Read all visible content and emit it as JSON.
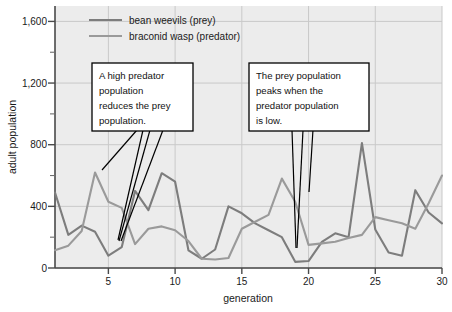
{
  "chart_data": {
    "type": "line",
    "title": "",
    "xlabel": "generation",
    "ylabel": "adult population",
    "xlim": [
      1,
      30
    ],
    "ylim": [
      0,
      1700
    ],
    "yticks": [
      0,
      400,
      800,
      1200,
      1600
    ],
    "ytick_labels": [
      "0",
      "400",
      "800",
      "1,200",
      "1,600"
    ],
    "yminorticks": [
      200,
      600,
      1000,
      1400
    ],
    "xticks": [
      5,
      10,
      15,
      20,
      25,
      30
    ],
    "xtick_labels": [
      "5",
      "10",
      "15",
      "20",
      "25",
      "30"
    ],
    "grid": true,
    "legend_position": "top-left-inside",
    "x": [
      1,
      2,
      3,
      4,
      5,
      6,
      7,
      8,
      9,
      10,
      11,
      12,
      13,
      14,
      15,
      16,
      17,
      18,
      19,
      20,
      21,
      22,
      23,
      24,
      25,
      26,
      27,
      28,
      29,
      30
    ],
    "series": [
      {
        "name": "bean weevils (prey)",
        "color": "#7d7d7d",
        "values": [
          490,
          215,
          275,
          235,
          80,
          135,
          500,
          375,
          615,
          560,
          115,
          60,
          120,
          400,
          355,
          290,
          245,
          200,
          40,
          45,
          170,
          225,
          200,
          810,
          250,
          100,
          80,
          505,
          360,
          290
        ]
      },
      {
        "name": "braconid wasp (predator)",
        "color": "#9a9a9a",
        "values": [
          115,
          145,
          240,
          620,
          430,
          390,
          155,
          255,
          270,
          245,
          175,
          60,
          55,
          65,
          255,
          300,
          345,
          580,
          430,
          150,
          160,
          170,
          195,
          215,
          330,
          310,
          290,
          255,
          420,
          600
        ]
      }
    ],
    "annotations": [
      {
        "id": "callout-predator-reduces-prey",
        "text": "A high predator population reduces the prey population.",
        "lines": [
          "A high predator",
          "population",
          "reduces the prey",
          "population."
        ],
        "points_to": [
          "generation 4 predator peak",
          "generation 5 prey low",
          "generation 6 predator"
        ]
      },
      {
        "id": "callout-prey-peaks",
        "text": "The prey population peaks when the predator population is low.",
        "lines": [
          "The prey population",
          "peaks when the",
          "predator population",
          "is low."
        ],
        "points_to": [
          "generation 19 prey low",
          "generation 20 predator"
        ]
      }
    ]
  },
  "axes": {
    "ylabel": "adult population",
    "xlabel": "generation"
  },
  "legend": {
    "items": [
      {
        "label": "bean weevils (prey)",
        "color": "#7d7d7d"
      },
      {
        "label": "braconid wasp (predator)",
        "color": "#9a9a9a"
      }
    ]
  },
  "callouts": [
    {
      "line1": "A high predator",
      "line2": "population",
      "line3": "reduces the prey",
      "line4": "population."
    },
    {
      "line1": "The prey population",
      "line2": "peaks when the",
      "line3": "predator population",
      "line4": "is low."
    }
  ],
  "yticks": [
    {
      "label": "1,600"
    },
    {
      "label": "1,200"
    },
    {
      "label": "800"
    },
    {
      "label": "400"
    },
    {
      "label": "0"
    }
  ],
  "xticks": [
    {
      "label": "5"
    },
    {
      "label": "10"
    },
    {
      "label": "15"
    },
    {
      "label": "20"
    },
    {
      "label": "25"
    },
    {
      "label": "30"
    }
  ],
  "colors": {
    "plot_background": "#ececec",
    "grid": "#c9c9c9",
    "axis": "#4a4a4a",
    "text": "#1a1a1a",
    "callout_border": "#000000",
    "callout_fill": "#ffffff"
  }
}
